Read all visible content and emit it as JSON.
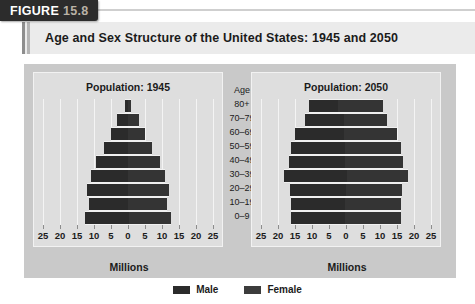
{
  "figure": {
    "tag_word": "FIGURE",
    "tag_number": "15.8",
    "title": "Age and Sex Structure of the United States: 1945 and 2050"
  },
  "age_column": {
    "header": "Age",
    "groups": [
      "80+",
      "70–79",
      "60–69",
      "50–59",
      "40–49",
      "30–39",
      "20–29",
      "10–19",
      "0–9"
    ]
  },
  "legend": {
    "position": "bottom-center",
    "items": [
      {
        "label": "Male",
        "color": "#2b2b2b",
        "swatch": "male"
      },
      {
        "label": "Female",
        "color": "#3c3c3c",
        "swatch": "female"
      }
    ]
  },
  "axis": {
    "tick_labels": [
      "25",
      "20",
      "15",
      "10",
      "5",
      "0",
      "5",
      "10",
      "15",
      "20",
      "25"
    ],
    "tick_values": [
      -25,
      -20,
      -15,
      -10,
      -5,
      0,
      5,
      10,
      15,
      20,
      25
    ],
    "title": "Millions",
    "limit": 25
  },
  "panels": [
    {
      "id": "panel-1945",
      "heading": "Population: 1945"
    },
    {
      "id": "panel-2050",
      "heading": "Population: 2050"
    }
  ],
  "chart_data": {
    "type": "bar",
    "subtype": "population-pyramid",
    "title": "Age and Sex Structure of the United States: 1945 and 2050",
    "xlabel": "Millions",
    "ylabel": "Age",
    "xlim": [
      -25,
      25
    ],
    "xticks": [
      -25,
      -20,
      -15,
      -10,
      -5,
      0,
      5,
      10,
      15,
      20,
      25
    ],
    "xtick_labels": [
      "25",
      "20",
      "15",
      "10",
      "5",
      "0",
      "5",
      "10",
      "15",
      "20",
      "25"
    ],
    "grid": true,
    "legend": [
      "Male",
      "Female"
    ],
    "legend_position": "bottom-center",
    "categories": [
      "80+",
      "70–79",
      "60–69",
      "50–59",
      "40–49",
      "30–39",
      "20–29",
      "10–19",
      "0–9"
    ],
    "panels": [
      {
        "name": "Population: 1945",
        "year": 1945,
        "series": [
          {
            "name": "Male",
            "side": "left",
            "values": [
              0.9,
              3.0,
              5.0,
              7.0,
              9.5,
              11.0,
              12.0,
              11.5,
              13.0
            ]
          },
          {
            "name": "Female",
            "side": "right",
            "values": [
              1.1,
              3.2,
              5.0,
              7.0,
              9.5,
              11.0,
              12.0,
              11.5,
              12.5
            ]
          }
        ]
      },
      {
        "name": "Population: 2050",
        "year": 2050,
        "series": [
          {
            "name": "Male",
            "side": "left",
            "values": [
              8.5,
              11.5,
              14.5,
              16.0,
              16.5,
              18.5,
              16.5,
              16.0,
              16.0
            ]
          },
          {
            "name": "Female",
            "side": "right",
            "values": [
              13.0,
              12.5,
              15.5,
              16.5,
              17.0,
              18.0,
              16.5,
              16.5,
              16.5
            ]
          }
        ]
      }
    ]
  }
}
